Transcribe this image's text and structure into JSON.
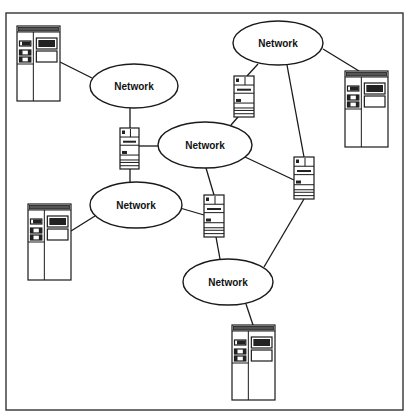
{
  "diagram": {
    "type": "network topology",
    "frame": {
      "x": 6,
      "y": 13,
      "width": 397,
      "height": 397
    },
    "networks": [
      {
        "id": "net-top-left",
        "label": "Network",
        "cx": 134,
        "cy": 86,
        "rx": 44,
        "ry": 22
      },
      {
        "id": "net-top-right",
        "label": "Network",
        "cx": 278,
        "cy": 43,
        "rx": 45,
        "ry": 22
      },
      {
        "id": "net-center",
        "label": "Network",
        "cx": 205,
        "cy": 145,
        "rx": 47,
        "ry": 23
      },
      {
        "id": "net-left",
        "label": "Network",
        "cx": 136,
        "cy": 205,
        "rx": 46,
        "ry": 23
      },
      {
        "id": "net-bottom",
        "label": "Network",
        "cx": 228,
        "cy": 282,
        "rx": 45,
        "ry": 23
      }
    ],
    "routers": [
      {
        "id": "router-1",
        "x": 120,
        "y": 128,
        "w": 19,
        "h": 41
      },
      {
        "id": "router-2",
        "x": 234,
        "y": 76,
        "w": 20,
        "h": 41
      },
      {
        "id": "router-3",
        "x": 294,
        "y": 157,
        "w": 20,
        "h": 42
      },
      {
        "id": "router-4",
        "x": 204,
        "y": 195,
        "w": 20,
        "h": 42
      }
    ],
    "workstations": [
      {
        "id": "workstation-1",
        "x": 17,
        "y": 26,
        "w": 43,
        "h": 75
      },
      {
        "id": "workstation-2",
        "x": 345,
        "y": 71,
        "w": 43,
        "h": 76
      },
      {
        "id": "workstation-3",
        "x": 28,
        "y": 204,
        "w": 43,
        "h": 76
      },
      {
        "id": "workstation-4",
        "x": 232,
        "y": 325,
        "w": 43,
        "h": 75
      }
    ],
    "links": [
      {
        "from": "workstation-1",
        "to": "net-top-left",
        "x1": 60,
        "y1": 62,
        "x2": 92,
        "y2": 78
      },
      {
        "from": "net-top-left",
        "to": "router-1",
        "x1": 130,
        "y1": 108,
        "x2": 130,
        "y2": 128
      },
      {
        "from": "router-1",
        "to": "net-center",
        "x1": 139,
        "y1": 146,
        "x2": 158,
        "y2": 146
      },
      {
        "from": "router-1",
        "to": "net-left",
        "x1": 130,
        "y1": 169,
        "x2": 130,
        "y2": 182
      },
      {
        "from": "net-left",
        "to": "workstation-3",
        "x1": 95,
        "y1": 216,
        "x2": 71,
        "y2": 231
      },
      {
        "from": "net-left",
        "to": "router-4",
        "x1": 180,
        "y1": 208,
        "x2": 204,
        "y2": 215
      },
      {
        "from": "net-center",
        "to": "router-4",
        "x1": 206,
        "y1": 168,
        "x2": 214,
        "y2": 195
      },
      {
        "from": "net-center",
        "to": "router-2",
        "x1": 231,
        "y1": 125,
        "x2": 238,
        "y2": 117
      },
      {
        "from": "net-center",
        "to": "router-3",
        "x1": 245,
        "y1": 157,
        "x2": 294,
        "y2": 180
      },
      {
        "from": "router-2",
        "to": "net-top-right",
        "x1": 247,
        "y1": 76,
        "x2": 258,
        "y2": 64
      },
      {
        "from": "net-top-right",
        "to": "router-3",
        "x1": 287,
        "y1": 65,
        "x2": 304,
        "y2": 157
      },
      {
        "from": "net-top-right",
        "to": "workstation-2",
        "x1": 323,
        "y1": 49,
        "x2": 359,
        "y2": 71
      },
      {
        "from": "router-3",
        "to": "net-bottom",
        "x1": 304,
        "y1": 199,
        "x2": 264,
        "y2": 267
      },
      {
        "from": "router-4",
        "to": "net-bottom",
        "x1": 216,
        "y1": 237,
        "x2": 220,
        "y2": 259
      },
      {
        "from": "net-bottom",
        "to": "workstation-4",
        "x1": 246,
        "y1": 304,
        "x2": 253,
        "y2": 325
      }
    ]
  }
}
